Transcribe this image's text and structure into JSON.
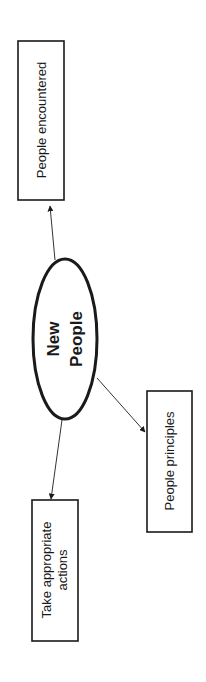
{
  "diagram": {
    "type": "mind-map",
    "orientation": "rotated-90-ccw",
    "center": {
      "lines": [
        "New",
        "People"
      ]
    },
    "nodes": [
      {
        "id": "people-encountered",
        "lines": [
          "People encountered"
        ]
      },
      {
        "id": "people-principles",
        "lines": [
          "People principles"
        ]
      },
      {
        "id": "take-appropriate-actions",
        "lines": [
          "Take appropriate",
          "actions"
        ]
      }
    ],
    "edges": [
      {
        "from": "center",
        "to": "people-encountered"
      },
      {
        "from": "center",
        "to": "people-principles"
      },
      {
        "from": "center",
        "to": "take-appropriate-actions"
      }
    ],
    "colors": {
      "stroke": "#1a1a1a",
      "background": "#ffffff"
    }
  }
}
